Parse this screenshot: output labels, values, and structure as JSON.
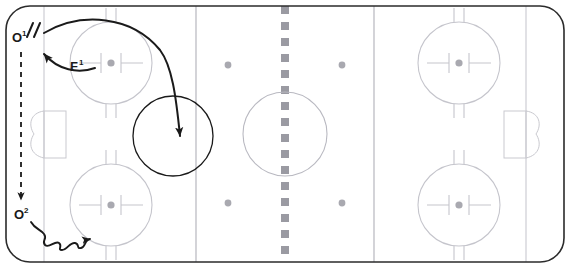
{
  "diagram": {
    "type": "hockey-rink-play-diagram",
    "background_color": "#ffffff"
  },
  "rink": {
    "name": "ice-hockey-rink",
    "border_color": "#2b2b2b",
    "surface_color": "#ffffff",
    "line_color": "#c9c9cf",
    "dot_color": "#a9a9b0",
    "center_line_color": "#9a9aa2",
    "bounds": {
      "x": 6,
      "y": 6,
      "width": 558,
      "height": 256,
      "corner_radius": 24
    },
    "zones": {
      "left_blue_line_x": 196,
      "right_blue_line_x": 374,
      "center_line_x": 285,
      "left_goal_line_x": 44,
      "right_goal_line_x": 526
    },
    "center_circle": {
      "cx": 285,
      "cy": 134,
      "r": 42
    },
    "faceoff_circles": [
      {
        "name": "faceoff-circle-top-left",
        "cx": 111,
        "cy": 63,
        "r": 41
      },
      {
        "name": "faceoff-circle-bottom-left",
        "cx": 111,
        "cy": 205,
        "r": 41
      },
      {
        "name": "faceoff-circle-top-right",
        "cx": 459,
        "cy": 63,
        "r": 41
      },
      {
        "name": "faceoff-circle-bottom-right",
        "cx": 459,
        "cy": 205,
        "r": 41
      }
    ],
    "neutral_zone_dots": [
      {
        "name": "neutral-dot-top-left",
        "cx": 228,
        "cy": 65
      },
      {
        "name": "neutral-dot-top-right",
        "cx": 342,
        "cy": 65
      },
      {
        "name": "neutral-dot-bottom-left",
        "cx": 228,
        "cy": 203
      },
      {
        "name": "neutral-dot-bottom-right",
        "cx": 342,
        "cy": 203
      }
    ],
    "goals": [
      {
        "name": "goal-left",
        "x": 44,
        "y": 112,
        "width": 22,
        "height": 46
      },
      {
        "name": "goal-right",
        "x": 504,
        "y": 112,
        "width": 22,
        "height": 46
      }
    ],
    "creases": [
      {
        "name": "crease-left",
        "side": "left"
      },
      {
        "name": "crease-right",
        "side": "right"
      }
    ]
  },
  "annotations": {
    "stroke_color": "#1a1a1a",
    "players": [
      {
        "id": "player-o1",
        "label_text": "O",
        "label_sup": "1",
        "x": 18,
        "y": 38,
        "marks": "//",
        "description": "Offensive player 1 at top-left corner with two tick marks"
      },
      {
        "id": "player-o2",
        "label_text": "O",
        "label_sup": "2",
        "x": 18,
        "y": 215,
        "marks": "",
        "description": "Offensive player 2 at lower-left"
      },
      {
        "id": "player-f1",
        "label_text": "F",
        "label_sup": "1",
        "x": 72,
        "y": 68,
        "marks": "",
        "description": "Forward 1 inside the top-left faceoff circle"
      }
    ],
    "paths": [
      {
        "id": "path-pass-f1-to-o1",
        "style": "solid-arrow",
        "description": "Curved pass arrow from F1 to O1"
      },
      {
        "id": "path-shot-o1-to-target",
        "style": "solid-arrow",
        "description": "Long sweeping arrow from O1 across ice into the circled target zone"
      },
      {
        "id": "path-skate-o1-to-o2",
        "style": "dashed-arrow",
        "description": "Dashed vertical arrow from O1 down to O2"
      },
      {
        "id": "path-carry-o2-to-circle",
        "style": "wavy-arrow",
        "description": "Wavy puck-carry arrow from O2 to the lower-left faceoff circle"
      }
    ],
    "target_zone": {
      "id": "target-circle",
      "cx": 173,
      "cy": 136,
      "r": 40,
      "description": "Hand drawn circle marking the target area of the play"
    }
  }
}
